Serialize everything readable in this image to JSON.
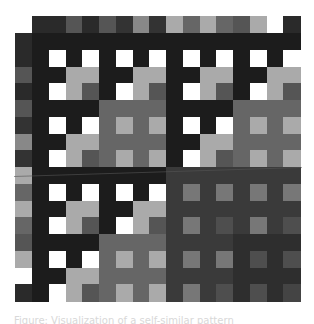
{
  "figure": {
    "palette": {
      "D": "#1c1c1c",
      "K": "#2a2a2a",
      "W": "#ffffff",
      "A": "#aaaaaa",
      "M": "#555555",
      "G": "#666666",
      "H": "#333333",
      "L": "#888888",
      "R": "#3a3a3a",
      "S": "#2e2e2e",
      "T": "#777777",
      "U": "#4e4e4e",
      "V": "#444444",
      ".": "transparent"
    },
    "cell_size": 16.75,
    "grid_origin": {
      "x": 32,
      "y": 33
    },
    "header_row": {
      "y": 16.25,
      "cells": "KKMKMHLHAGAGMAWK"
    },
    "left_column": {
      "x": 15.25,
      "cells": "KKMKMHLHAGAGMAWK"
    },
    "rows": [
      "DDDDDDDDDDDDDDDD",
      "DWDWDWDWDWDWDWDW",
      "DDAADDAADDAADDAA",
      "DWAMDWAMDWAMDWAM",
      "DDDDGGGGDDDDGGGG",
      "DWDWGAGADWDWGAGA",
      "DDAAGGGGDDAAGGGG",
      "DWAMGAGADWAMGAGA",
      "DDDDDDDDRRRRRRRR",
      "DWDWDWDWRTRTRTRT",
      "DDAADDAARRRRRRRR",
      "DWAMDWAMRTRURTRU",
      "DDDDGGGGRRRRSSSS",
      "DWDWGAGARTRTSUSU",
      "DDAAGGGGRRRRSSSS",
      "DWAMGAGARTRUSUSV"
    ]
  },
  "caption": {
    "text": "Figure: Visualization of a self-similar pattern"
  }
}
